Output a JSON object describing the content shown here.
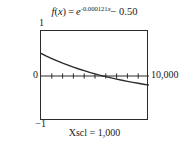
{
  "figure": {
    "title_parts": {
      "fname": "f",
      "open_paren": "(",
      "variable": "x",
      "close_paren": ")",
      "equals": "=",
      "base": "e",
      "exponent_coefficient": "-0.000121",
      "exponent_variable": "x",
      "constant_term": "− 0.50"
    },
    "title_plain": "f(x) = e^(-0.000121x) - 0.50",
    "caption": "Xscl = 1,000",
    "axis_labels": {
      "y_max": "1",
      "y_zero": "0",
      "y_min": "−1",
      "x_max": "10,000"
    },
    "colors": {
      "frame": "#2b2b2b",
      "curve": "#2b2b2b",
      "axis": "#2b2b2b",
      "background": "#ffffff"
    }
  },
  "chart_data": {
    "type": "line",
    "xlabel": "",
    "ylabel": "",
    "xlim": [
      0,
      10000
    ],
    "ylim": [
      -1,
      1
    ],
    "xscl": 1000,
    "yscl": 1,
    "grid": false,
    "legend": null,
    "annotations": [
      "Xscl = 1,000"
    ],
    "series": [
      {
        "name": "f(x) = e^(-0.000121x) - 0.50",
        "x": [
          0,
          500,
          1000,
          1500,
          2000,
          2500,
          3000,
          3500,
          4000,
          4500,
          5000,
          5500,
          5727,
          6000,
          6500,
          7000,
          7500,
          8000,
          8500,
          9000,
          9500,
          10000
        ],
        "y": [
          0.5,
          0.441,
          0.386,
          0.334,
          0.285,
          0.24,
          0.197,
          0.156,
          0.118,
          0.082,
          0.047,
          0.015,
          0.0,
          -0.015,
          -0.043,
          -0.07,
          -0.095,
          -0.119,
          -0.141,
          -0.162,
          -0.182,
          -0.202
        ]
      }
    ],
    "x_ticks": [
      1000,
      2000,
      3000,
      4000,
      5000,
      6000,
      7000,
      8000,
      9000
    ],
    "x_tick_labels": [],
    "y_ticks": [],
    "zero_crossing_x": 5727
  }
}
